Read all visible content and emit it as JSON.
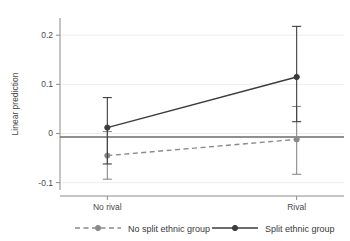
{
  "chart_data": {
    "type": "line",
    "title": "",
    "subtitle": "",
    "xlabel": "",
    "ylabel": "Linear prediction",
    "categories": [
      "No rival",
      "Rival"
    ],
    "x": [
      0,
      1
    ],
    "xlim": [
      -0.25,
      1.25
    ],
    "ylim": [
      -0.115,
      0.235
    ],
    "yticks": [
      0.2,
      0.1,
      0,
      -0.1
    ],
    "ytick_labels": [
      "0.2",
      "0.1",
      "0",
      "-0.1"
    ],
    "xtick_labels": [
      "No rival",
      "Rival"
    ],
    "grid": "horizontal-light",
    "zero_line": true,
    "legend_position": "bottom",
    "series": [
      {
        "name": "No split ethnic group",
        "style": "dashed",
        "color": "#8a8a8a",
        "marker": "circle",
        "values": [
          -0.045,
          -0.012
        ],
        "ci_low": [
          -0.093,
          -0.083
        ],
        "ci_high": [
          0.004,
          0.055
        ]
      },
      {
        "name": "Split ethnic group",
        "style": "solid",
        "color": "#3c3c3c",
        "marker": "circle",
        "values": [
          0.012,
          0.115
        ],
        "ci_low": [
          -0.062,
          0.024
        ],
        "ci_high": [
          0.073,
          0.218
        ]
      }
    ]
  },
  "legend": {
    "items": [
      {
        "label": "No split ethnic group",
        "style": "dashed",
        "color": "#8a8a8a"
      },
      {
        "label": "Split ethnic group",
        "style": "solid",
        "color": "#3c3c3c"
      }
    ]
  },
  "colors": {
    "split_group": "#3c3c3c",
    "no_split_group": "#8a8a8a",
    "axis": "#8c8c8c",
    "gridline": "#ededed",
    "zero_line": "#6b6b6b",
    "background": "#ffffff"
  }
}
